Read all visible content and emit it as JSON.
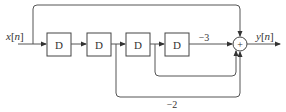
{
  "diagram": {
    "title": "",
    "input_label": "x[n]",
    "output_label": "y[n]",
    "delay_blocks": [
      {
        "label": "D"
      },
      {
        "label": "D"
      },
      {
        "label": "D"
      },
      {
        "label": "D"
      }
    ],
    "summer": {
      "symbol": "+"
    },
    "gains": [
      {
        "value": "−3",
        "description": "gain on path from fourth delay output to summer"
      },
      {
        "value": "−2",
        "description": "gain on path from second delay output to summer"
      }
    ],
    "paths": [
      {
        "from": "x[n]",
        "to": "summer",
        "gain": "1"
      },
      {
        "from": "delay-2-output",
        "to": "summer",
        "gain": "−2"
      },
      {
        "from": "delay-3-output",
        "to": "summer",
        "gain": "1"
      },
      {
        "from": "delay-4-output",
        "to": "summer",
        "gain": "−3"
      }
    ],
    "colors": {
      "line": "#555555",
      "text": "#333333",
      "background": "#ffffff"
    }
  }
}
